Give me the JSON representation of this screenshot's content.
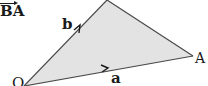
{
  "diagram": {
    "type": "vector-triangle",
    "colors": {
      "fill": "#e3e3e3",
      "stroke": "#4a4a4a",
      "text": "#1a1a1a"
    },
    "vertices": {
      "O": {
        "label": "O",
        "x": 24,
        "y": 86
      },
      "A": {
        "label": "A",
        "x": 193,
        "y": 56
      },
      "B": {
        "x": 107,
        "y": 0
      }
    },
    "labels": {
      "vector_ba": "BA",
      "vector_b": "b",
      "vector_a": "a",
      "point_A": "A",
      "point_O": "O"
    },
    "edges": [
      {
        "from": "O",
        "to": "B",
        "label": "b",
        "arrow": true
      },
      {
        "from": "O",
        "to": "A",
        "label": "a",
        "arrow": true
      },
      {
        "from": "B",
        "to": "A",
        "arrow": false
      }
    ]
  }
}
